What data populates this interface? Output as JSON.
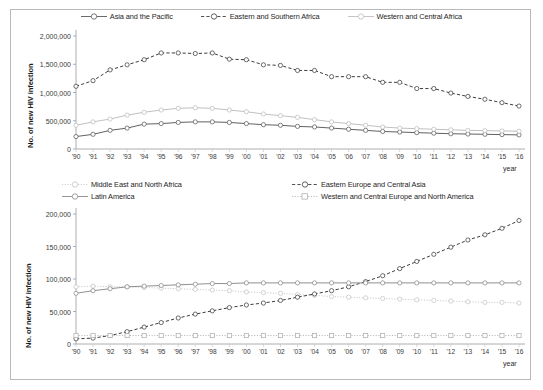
{
  "figure": {
    "background": "#ffffff",
    "frame_color": "#b9b9b9"
  },
  "chart_data": [
    {
      "type": "line",
      "id": "top",
      "title": "",
      "xlabel": "year",
      "ylabel": "No. of new HIV infection",
      "ylim": [
        0,
        2000000
      ],
      "yticks": [
        0,
        500000,
        1000000,
        1500000,
        2000000
      ],
      "ytick_labels": [
        "0",
        "500,000",
        "1,000,000",
        "1,500,000",
        "2,000,000"
      ],
      "grid": false,
      "legend_position": "top-center",
      "x": [
        "1990",
        "1991",
        "1992",
        "1993",
        "1994",
        "1995",
        "1996",
        "1997",
        "1998",
        "1999",
        "2000",
        "2001",
        "2002",
        "2003",
        "2004",
        "2005",
        "2006",
        "2007",
        "2008",
        "2009",
        "2010",
        "2011",
        "2012",
        "2013",
        "2014",
        "2015",
        "2016"
      ],
      "xtick_labels": [
        "'90",
        "'91",
        "'92",
        "'93",
        "'94",
        "'95",
        "'96",
        "'97",
        "'98",
        "'99",
        "'00",
        "'01",
        "'02",
        "'03",
        "'04",
        "'05",
        "'06",
        "'07",
        "'08",
        "'09",
        "'10",
        "'11",
        "'12",
        "'13",
        "'14",
        "'15",
        "'16"
      ],
      "series": [
        {
          "name": "Asia and the Pacific",
          "color": "#595959",
          "dash": "solid",
          "marker": "circle",
          "values": [
            220000,
            260000,
            330000,
            370000,
            440000,
            450000,
            470000,
            480000,
            480000,
            470000,
            450000,
            430000,
            420000,
            400000,
            390000,
            370000,
            350000,
            330000,
            310000,
            300000,
            290000,
            280000,
            270000,
            265000,
            260000,
            255000,
            250000
          ]
        },
        {
          "name": "Eastern and Southern Africa",
          "color": "#3d3d3d",
          "dash": "dashed",
          "marker": "circle",
          "values": [
            1110000,
            1210000,
            1400000,
            1490000,
            1580000,
            1700000,
            1700000,
            1690000,
            1700000,
            1590000,
            1580000,
            1490000,
            1480000,
            1390000,
            1390000,
            1280000,
            1280000,
            1280000,
            1180000,
            1180000,
            1070000,
            1070000,
            990000,
            930000,
            880000,
            820000,
            760000
          ]
        },
        {
          "name": "Western and Central Africa",
          "color": "#bdbdbd",
          "dash": "solid",
          "marker": "circle",
          "values": [
            420000,
            480000,
            530000,
            600000,
            650000,
            690000,
            720000,
            730000,
            720000,
            690000,
            660000,
            620000,
            590000,
            560000,
            520000,
            480000,
            450000,
            420000,
            390000,
            370000,
            360000,
            350000,
            340000,
            330000,
            325000,
            320000,
            315000
          ]
        }
      ]
    },
    {
      "type": "line",
      "id": "bottom",
      "title": "",
      "xlabel": "year",
      "ylabel": "No. of new  HIV infection",
      "ylim": [
        0,
        200000
      ],
      "yticks": [
        0,
        50000,
        100000,
        150000,
        200000
      ],
      "ytick_labels": [
        "0",
        "50,000",
        "100,000",
        "150,000",
        "200,000"
      ],
      "grid": false,
      "legend_position": "top",
      "x": [
        "1990",
        "1991",
        "1992",
        "1993",
        "1994",
        "1995",
        "1996",
        "1997",
        "1998",
        "1999",
        "2000",
        "2001",
        "2002",
        "2003",
        "2004",
        "2005",
        "2006",
        "2007",
        "2008",
        "2009",
        "2010",
        "2011",
        "2012",
        "2013",
        "2014",
        "2015",
        "2016"
      ],
      "xtick_labels": [
        "'90",
        "'91",
        "'92",
        "'93",
        "'94",
        "'95",
        "'96",
        "'97",
        "'98",
        "'99",
        "'00",
        "'01",
        "'02",
        "'03",
        "'04",
        "'05",
        "'06",
        "'07",
        "'08",
        "'09",
        "'10",
        "'11",
        "'12",
        "'13",
        "'14",
        "'15",
        "'16"
      ],
      "series": [
        {
          "name": "Middle East and North Africa",
          "color": "#c4c4c4",
          "dash": "dotted",
          "marker": "circle",
          "values": [
            88000,
            89000,
            88000,
            88000,
            87000,
            86000,
            85000,
            84000,
            83000,
            82000,
            80000,
            79000,
            78000,
            76000,
            75000,
            73000,
            72000,
            71000,
            70000,
            69000,
            68000,
            67000,
            66000,
            65000,
            64000,
            64000,
            63000
          ]
        },
        {
          "name": "Eastern Europe and Central Asia",
          "color": "#3d3d3d",
          "dash": "dashed",
          "marker": "circle",
          "values": [
            8000,
            9000,
            13000,
            19000,
            26000,
            33000,
            40000,
            46000,
            51000,
            56000,
            60000,
            63000,
            67000,
            72000,
            77000,
            82000,
            88000,
            96000,
            105000,
            116000,
            127000,
            138000,
            149000,
            160000,
            168000,
            178000,
            190000
          ]
        },
        {
          "name": "Latin America",
          "color": "#8a8a8a",
          "dash": "solid",
          "marker": "circle",
          "values": [
            78000,
            82000,
            85000,
            88000,
            89000,
            90000,
            91000,
            92000,
            93000,
            93000,
            94000,
            94000,
            94000,
            94000,
            94000,
            94000,
            94000,
            94000,
            94000,
            94000,
            94000,
            94000,
            94000,
            94000,
            94000,
            94000,
            94000
          ]
        },
        {
          "name": "Western and Central Europe and North America",
          "color": "#b0b0b0",
          "dash": "dotted",
          "marker": "square",
          "values": [
            13000,
            13000,
            13000,
            13000,
            13000,
            13000,
            13000,
            13000,
            13000,
            13000,
            13000,
            13000,
            13000,
            13000,
            13000,
            13000,
            13000,
            13000,
            13000,
            13000,
            13000,
            13000,
            13000,
            13000,
            13000,
            13000,
            13000
          ]
        }
      ]
    }
  ]
}
